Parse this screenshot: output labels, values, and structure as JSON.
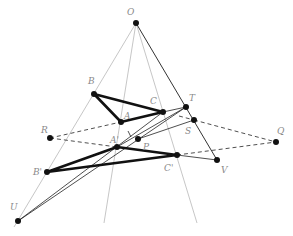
{
  "diagram": {
    "colors": {
      "thin_gray": "#b5b5b5",
      "black": "#1a1a1a",
      "label": "#8a8a8a"
    },
    "points": {
      "O": {
        "label": "O",
        "x": 136,
        "y": 23,
        "lx": 127,
        "ly": 15
      },
      "B": {
        "label": "B",
        "x": 94,
        "y": 94,
        "lx": 88,
        "ly": 84
      },
      "C": {
        "label": "C",
        "x": 163,
        "y": 112,
        "lx": 150,
        "ly": 104
      },
      "A": {
        "label": "A",
        "x": 121,
        "y": 122,
        "lx": 124,
        "ly": 119
      },
      "T": {
        "label": "T",
        "x": 186,
        "y": 107,
        "lx": 189,
        "ly": 101
      },
      "S": {
        "label": "S",
        "x": 194,
        "y": 120,
        "lx": 185,
        "ly": 134
      },
      "R": {
        "label": "R",
        "x": 50,
        "y": 138,
        "lx": 41,
        "ly": 133
      },
      "Q": {
        "label": "Q",
        "x": 276,
        "y": 142,
        "lx": 277,
        "ly": 134
      },
      "A2": {
        "label": "A'",
        "x": 117,
        "y": 147,
        "lx": 110,
        "ly": 143
      },
      "P": {
        "label": "P",
        "x": 138,
        "y": 139,
        "lx": 143,
        "ly": 150
      },
      "B2": {
        "label": "B'",
        "x": 47,
        "y": 172,
        "lx": 33,
        "ly": 175
      },
      "C2": {
        "label": "C'",
        "x": 177,
        "y": 155,
        "lx": 164,
        "ly": 171
      },
      "V": {
        "label": "V",
        "x": 217,
        "y": 160,
        "lx": 221,
        "ly": 173
      },
      "U": {
        "label": "U",
        "x": 18,
        "y": 221,
        "lx": 10,
        "ly": 210
      }
    }
  }
}
